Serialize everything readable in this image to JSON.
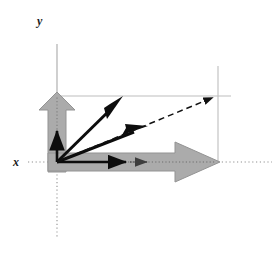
{
  "figure": {
    "title": "",
    "type": "vector-diagram",
    "background_color": "#ffffff",
    "width": 277,
    "height": 257
  },
  "axes": {
    "x_label": "x",
    "y_label": "y",
    "x_label_pos": {
      "x": 16,
      "y": 162
    },
    "y_label_pos": {
      "x": 40,
      "y": 24
    },
    "origin": {
      "x": 57,
      "y": 162
    },
    "x_axis": {
      "x1": 28,
      "y1": 162,
      "x2": 272,
      "y2": 162,
      "style": "dotted",
      "color": "#8c8c8c"
    },
    "y_axis": {
      "x1": 57,
      "y1": 44,
      "x2": 57,
      "y2": 237,
      "style": "solid-top-dotted-bottom",
      "color": "#a6a6a6"
    }
  },
  "guides": {
    "color": "#b3b3b3",
    "horizontal": {
      "x1": 57,
      "y1": 96,
      "x2": 231,
      "y2": 96,
      "label": "horizontal-projection-guide"
    },
    "vertical": {
      "x1": 218,
      "y1": 66,
      "x2": 218,
      "y2": 163,
      "label": "vertical-projection-guide"
    }
  },
  "vectors": [
    {
      "name": "gray-up-arrow",
      "style": "block-arrow",
      "color": "#a9a9a9",
      "stroke": "#8f8f8f",
      "from": {
        "x": 57,
        "y": 170
      },
      "to": {
        "x": 57,
        "y": 93
      },
      "direction": "up"
    },
    {
      "name": "gray-right-arrow",
      "style": "block-arrow",
      "color": "#a9a9a9",
      "stroke": "#8f8f8f",
      "from": {
        "x": 50,
        "y": 162
      },
      "to": {
        "x": 219,
        "y": 162
      },
      "direction": "right"
    },
    {
      "name": "black-vertical-component-arrow",
      "style": "line-arrow",
      "color": "#0d0d0d",
      "from": {
        "x": 57,
        "y": 162
      },
      "to": {
        "x": 57,
        "y": 128
      }
    },
    {
      "name": "black-horizontal-component-arrow",
      "style": "line-arrow",
      "color": "#0d0d0d",
      "from": {
        "x": 57,
        "y": 162
      },
      "to": {
        "x": 129,
        "y": 162
      }
    },
    {
      "name": "black-horizontal-dotted-extension-arrow",
      "style": "dotted-line-arrow",
      "color": "#4d4d4d",
      "from": {
        "x": 129,
        "y": 162
      },
      "to": {
        "x": 150,
        "y": 162
      }
    },
    {
      "name": "black-steep-vector",
      "style": "stealth-arrow",
      "color": "#0d0d0d",
      "from": {
        "x": 57,
        "y": 162
      },
      "to": {
        "x": 123,
        "y": 97
      }
    },
    {
      "name": "black-shallow-vector",
      "style": "stealth-arrow",
      "color": "#0d0d0d",
      "from": {
        "x": 57,
        "y": 162
      },
      "to": {
        "x": 148,
        "y": 126
      }
    },
    {
      "name": "dashed-resultant-vector",
      "style": "dashed-arrow",
      "color": "#1a1a1a",
      "from": {
        "x": 57,
        "y": 162
      },
      "to": {
        "x": 217,
        "y": 96
      }
    }
  ],
  "dotted_overlays": [
    {
      "name": "up-arrow-shaft-dotted-overlay",
      "from": {
        "x": 57,
        "y": 162
      },
      "to": {
        "x": 57,
        "y": 96
      },
      "color": "#8a8a8a"
    }
  ]
}
